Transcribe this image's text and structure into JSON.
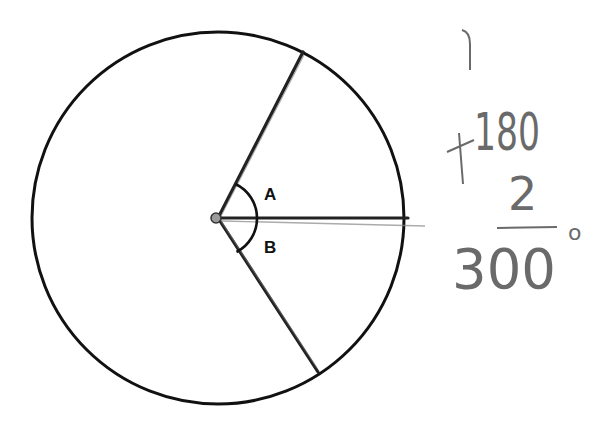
{
  "diagram": {
    "angle_labels": [
      "A",
      "B"
    ],
    "colors": {
      "ink": "#111111",
      "pencil": "#6a6a6a"
    }
  },
  "handwriting": {
    "carry_mark": "1",
    "addend_top": "180",
    "operator": "+",
    "addend_bottom": "2",
    "sum": "300",
    "degree_symbol": "o"
  }
}
